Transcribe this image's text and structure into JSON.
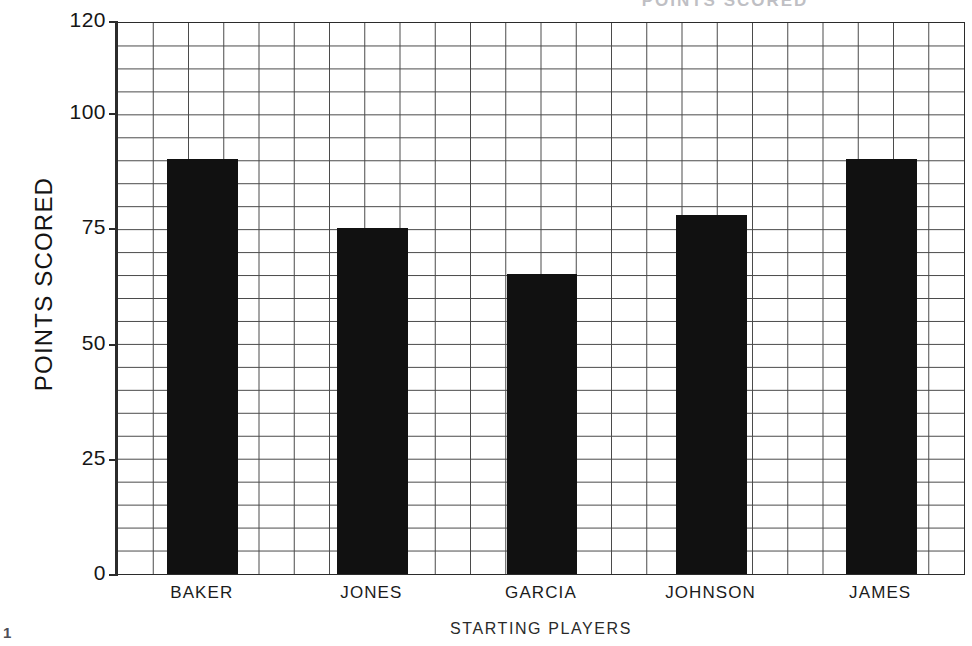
{
  "chart_data": {
    "type": "bar",
    "title": "POINTS SCORED",
    "xlabel": "STARTING PLAYERS",
    "ylabel": "POINTS SCORED",
    "categories": [
      "BAKER",
      "JONES",
      "GARCIA",
      "JOHNSON",
      "JAMES"
    ],
    "values": [
      90,
      75,
      65,
      78,
      90
    ],
    "ylim": [
      0,
      120
    ],
    "yticks": [
      0,
      25,
      50,
      75,
      100,
      120
    ],
    "ytick_labels": [
      "0",
      "25",
      "50",
      "75",
      "100",
      "120"
    ],
    "grid": true,
    "grid_columns": 24,
    "grid_rows": 24,
    "legend": null,
    "bar_color": "#111111",
    "grid_color": "#4a4a4a",
    "axis_color": "#2b2b2b"
  },
  "figure": {
    "page_number": "1"
  }
}
